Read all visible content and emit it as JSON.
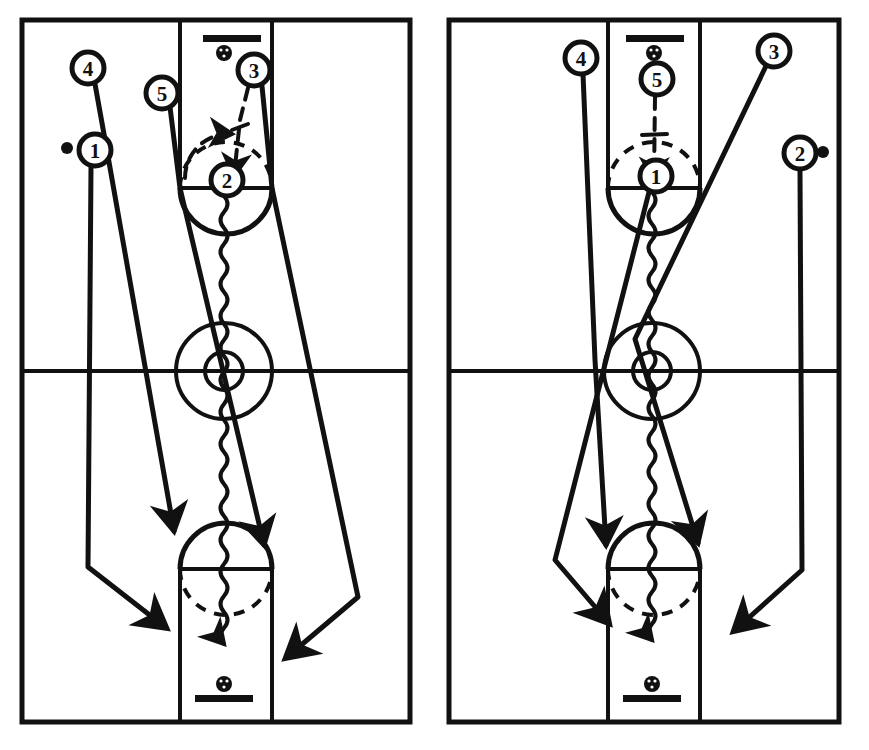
{
  "page": {
    "width": 869,
    "height": 750,
    "background_color": "#ffffff",
    "ink_color": "#111111"
  },
  "legend": {
    "solid_line_meaning": "player movement / cut",
    "dashed_line_meaning": "pass",
    "wavy_line_meaning": "dribble",
    "filled_dot_meaning": "ball",
    "circled_number_meaning": "offensive player"
  },
  "diagrams": [
    {
      "id": "frame-1",
      "name": "left-diagram",
      "label": "1",
      "court": {
        "outline": "full-court rectangle",
        "midcourt_line": true,
        "center_circle": true,
        "center_inner_circle": true,
        "top_key": true,
        "bottom_key": true,
        "top_basket": true,
        "bottom_basket": true
      },
      "players": [
        {
          "number": "4",
          "name": "player-4",
          "cx": 88,
          "cy": 68,
          "has_ball": false
        },
        {
          "number": "1",
          "name": "player-1",
          "cx": 95,
          "cy": 150,
          "has_ball": true
        },
        {
          "number": "5",
          "name": "player-5",
          "cx": 162,
          "cy": 93,
          "has_ball": false
        },
        {
          "number": "3",
          "name": "player-3",
          "cx": 254,
          "cy": 70,
          "has_ball": false
        },
        {
          "number": "2",
          "name": "player-2",
          "cx": 227,
          "cy": 180,
          "has_ball": false
        }
      ],
      "ball_dot": {
        "cx": 67,
        "cy": 148
      },
      "actions": [
        {
          "type": "pass",
          "name": "pass-3-to-2",
          "from": "3",
          "to": "2"
        },
        {
          "type": "dribble",
          "name": "dribble-2-downcourt",
          "from": "2",
          "to": "bottom key"
        },
        {
          "type": "cut",
          "name": "cut-4-to-wing",
          "from": "4",
          "to": "left low wing"
        },
        {
          "type": "cut",
          "name": "cut-1-to-baseline",
          "from": "1",
          "to": "left baseline corner"
        },
        {
          "type": "cut",
          "name": "cut-5-to-lane",
          "from": "5",
          "to": "bottom lane"
        },
        {
          "type": "cut",
          "name": "cut-3-to-corner",
          "from": "3",
          "to": "right baseline corner"
        }
      ]
    },
    {
      "id": "frame-2",
      "name": "right-diagram",
      "label": "2",
      "court": {
        "outline": "full-court rectangle",
        "midcourt_line": true,
        "center_circle": true,
        "center_inner_circle": true,
        "top_key": true,
        "bottom_key": true,
        "top_basket": true,
        "bottom_basket": true
      },
      "players": [
        {
          "number": "4",
          "name": "player-4",
          "cx": 146,
          "cy": 58,
          "has_ball": false
        },
        {
          "number": "5",
          "name": "player-5",
          "cx": 222,
          "cy": 79,
          "has_ball": false
        },
        {
          "number": "3",
          "name": "player-3",
          "cx": 339,
          "cy": 51,
          "has_ball": false
        },
        {
          "number": "2",
          "name": "player-2",
          "cx": 365,
          "cy": 153,
          "has_ball": true
        },
        {
          "number": "1",
          "name": "player-1",
          "cx": 221,
          "cy": 176,
          "has_ball": false
        }
      ],
      "ball_dot": {
        "cx": 388,
        "cy": 152
      },
      "actions": [
        {
          "type": "pass",
          "name": "pass-5-to-1",
          "from": "5",
          "to": "1"
        },
        {
          "type": "dribble",
          "name": "dribble-1-downcourt",
          "from": "1",
          "to": "bottom key"
        },
        {
          "type": "cut",
          "name": "cut-4-to-lane",
          "from": "4",
          "to": "bottom lane"
        },
        {
          "type": "cut",
          "name": "cut-3-to-lane",
          "from": "3",
          "to": "bottom right lane"
        },
        {
          "type": "cut",
          "name": "cut-1-to-corner",
          "from": "1",
          "to": "left baseline corner"
        },
        {
          "type": "cut",
          "name": "cut-2-to-corner",
          "from": "2",
          "to": "right baseline corner"
        }
      ]
    }
  ]
}
